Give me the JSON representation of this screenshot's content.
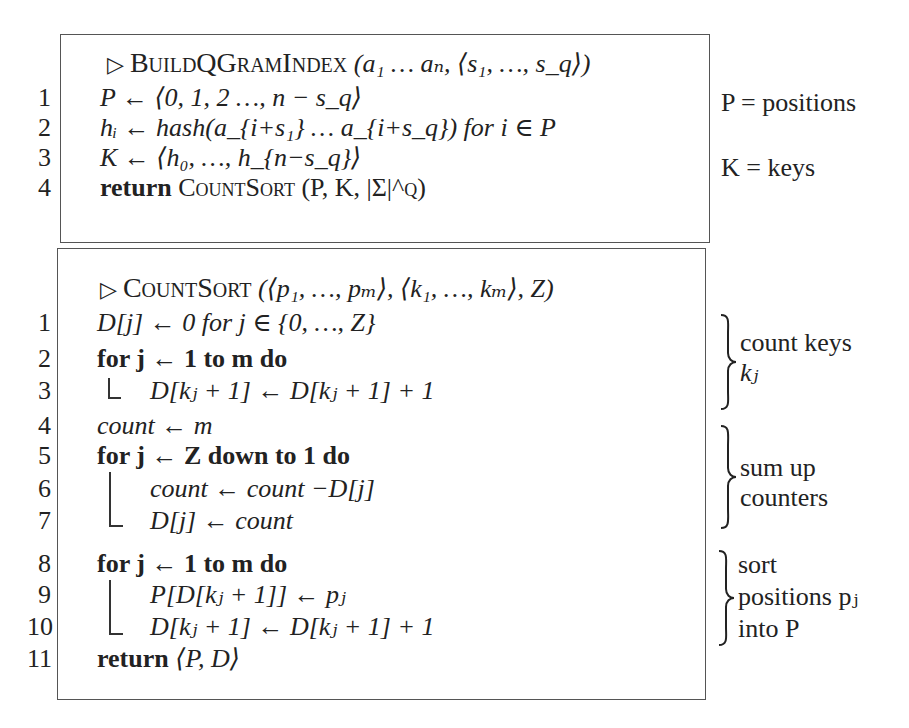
{
  "algorithm1": {
    "header_marker": "▷",
    "name": "BuildQGramIndex",
    "args": "(a₁ … aₙ, ⟨s₁, …, s_q⟩)",
    "lines": [
      {
        "num": "1",
        "text": "P ← ⟨0, 1, 2 …, n − s_q⟩"
      },
      {
        "num": "2",
        "text": "hᵢ ← hash(a_{i+s₁} … a_{i+s_q}) for i ∈ P"
      },
      {
        "num": "3",
        "text": "K ← ⟨h₀, …, h_{n−s_q}⟩"
      },
      {
        "num": "4",
        "keyword": "return",
        "text": "CountSort (P, K, |Σ|^q)"
      }
    ],
    "annotations": [
      {
        "text": "P = positions"
      },
      {
        "text": "K = keys"
      }
    ]
  },
  "algorithm2": {
    "header_marker": "▷",
    "name": "CountSort",
    "args": "(⟨p₁, …, pₘ⟩, ⟨k₁, …, kₘ⟩, Z)",
    "lines": [
      {
        "num": "1",
        "text": "D[j] ← 0 for j ∈ {0, …, Z}"
      },
      {
        "num": "2",
        "text": "for j ← 1 to m do"
      },
      {
        "num": "3",
        "text": "D[kⱼ + 1] ← D[kⱼ + 1] + 1"
      },
      {
        "num": "4",
        "text": "count ← m"
      },
      {
        "num": "5",
        "text": "for j ← Z down to 1 do"
      },
      {
        "num": "6",
        "text": "count ← count −D[j]"
      },
      {
        "num": "7",
        "text": "D[j] ← count"
      },
      {
        "num": "8",
        "text": "for j ← 1 to m do"
      },
      {
        "num": "9",
        "text": "P[D[kⱼ + 1]] ← pⱼ"
      },
      {
        "num": "10",
        "text": "D[kⱼ + 1] ← D[kⱼ + 1] + 1"
      },
      {
        "num": "11",
        "keyword": "return",
        "text": "⟨P, D⟩"
      }
    ],
    "annotations": [
      {
        "lines": [
          "count keys",
          "kⱼ"
        ]
      },
      {
        "lines": [
          "sum up",
          "counters"
        ]
      },
      {
        "lines": [
          "sort",
          "positions pⱼ",
          "into P"
        ]
      }
    ]
  }
}
